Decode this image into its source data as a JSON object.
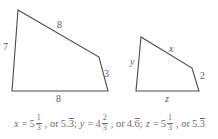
{
  "figure": {
    "stroke_color": "#4a4a4a",
    "text_color": "#5b5b5b",
    "background": "#ffffff",
    "shapes": [
      {
        "name": "large-quadrilateral",
        "points": "18,10 99,57 108,91 12,91",
        "labels": [
          {
            "name": "label-left-side-7",
            "text": "7",
            "x": 3,
            "y": 42,
            "italic": false
          },
          {
            "name": "label-top-side-8",
            "text": "8",
            "x": 57,
            "y": 20,
            "italic": false
          },
          {
            "name": "label-right-side-3",
            "text": "3",
            "x": 104,
            "y": 69,
            "italic": false
          },
          {
            "name": "label-bottom-side-8",
            "text": "8",
            "x": 56,
            "y": 94,
            "italic": false
          }
        ]
      },
      {
        "name": "small-quadrilateral",
        "points": "141,37 192,68 199,91 136,91",
        "labels": [
          {
            "name": "label-left-side-y",
            "text": "y",
            "x": 130,
            "y": 57,
            "italic": true
          },
          {
            "name": "label-top-side-x",
            "text": "x",
            "x": 169,
            "y": 44,
            "italic": true
          },
          {
            "name": "label-right-side-2",
            "text": "2",
            "x": 200,
            "y": 71,
            "italic": false
          },
          {
            "name": "label-bottom-side-z",
            "text": "z",
            "x": 165,
            "y": 94,
            "italic": true
          }
        ]
      }
    ]
  },
  "answer": {
    "name": "answer-line",
    "full_text": "x = 5 1/3, or 5.3̅; y = 4 2/3, or 4.6̅; z = 5 1/3, or 5.3̅",
    "parts": {
      "x_var": "x",
      "x_eq": "=",
      "x_whole": "5",
      "x_num": "1",
      "x_den": "3",
      "x_or": ", or",
      "x_dec_lead": "5.",
      "x_dec_rep": "3",
      "x_semi": ";",
      "y_var": "y",
      "y_eq": "=",
      "y_whole": "4",
      "y_num": "2",
      "y_den": "3",
      "y_or": ", or",
      "y_dec_lead": "4.",
      "y_dec_rep": "6",
      "y_semi": ";",
      "z_var": "z",
      "z_eq": "=",
      "z_whole": "5",
      "z_num": "1",
      "z_den": "3",
      "z_or": ", or",
      "z_dec_lead": "5.",
      "z_dec_rep": "3"
    }
  }
}
